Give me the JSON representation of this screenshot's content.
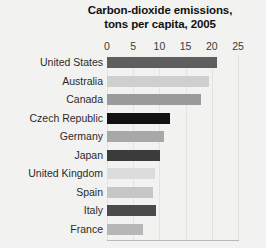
{
  "chart_data": {
    "type": "bar",
    "orientation": "horizontal",
    "title": "Carbon-dioxide emissions, tons per capita, 2005",
    "title_lines": [
      "Carbon-dioxide emissions,",
      "tons per capita, 2005"
    ],
    "xlabel": "",
    "ylabel": "",
    "xlim": [
      0,
      25
    ],
    "xticks": [
      0,
      5,
      10,
      15,
      20,
      25
    ],
    "xtick_labels": [
      "0",
      "5",
      "10",
      "15",
      "20",
      "25"
    ],
    "grid": true,
    "legend": "none",
    "categories": [
      "United States",
      "Australia",
      "Canada",
      "Czech Republic",
      "Germany",
      "Japan",
      "United Kingdom",
      "Spain",
      "Italy",
      "France"
    ],
    "values": [
      20.9,
      19.4,
      18.0,
      12.1,
      10.8,
      10.2,
      9.2,
      8.7,
      9.4,
      6.9
    ],
    "bar_colors": [
      "#5e5e5e",
      "#cfcfcf",
      "#9a9a9a",
      "#111111",
      "#a8a8a8",
      "#3b3b3b",
      "#dcdcdc",
      "#c6c6c6",
      "#4a4a4a",
      "#b6b6b6"
    ],
    "bars": [
      {
        "label": "United States",
        "value": 20.9,
        "color": "#5e5e5e"
      },
      {
        "label": "Australia",
        "value": 19.4,
        "color": "#cfcfcf"
      },
      {
        "label": "Canada",
        "value": 18.0,
        "color": "#9a9a9a"
      },
      {
        "label": "Czech Republic",
        "value": 12.1,
        "color": "#111111"
      },
      {
        "label": "Germany",
        "value": 10.8,
        "color": "#a8a8a8"
      },
      {
        "label": "Japan",
        "value": 10.2,
        "color": "#3b3b3b"
      },
      {
        "label": "United Kingdom",
        "value": 9.2,
        "color": "#dcdcdc"
      },
      {
        "label": "Spain",
        "value": 8.7,
        "color": "#c6c6c6"
      },
      {
        "label": "Italy",
        "value": 9.4,
        "color": "#4a4a4a"
      },
      {
        "label": "France",
        "value": 6.9,
        "color": "#b6b6b6"
      }
    ],
    "background_color": "#f2f2f0",
    "axis_color": "#b9b9b5",
    "grid_color": "#e3e3e0",
    "text_color": "#2b2b2b"
  }
}
